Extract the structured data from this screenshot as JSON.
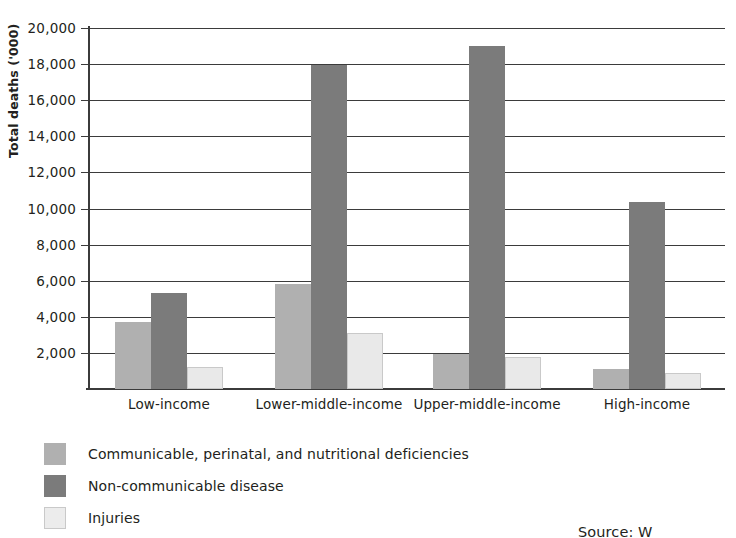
{
  "chart_data": {
    "type": "bar",
    "title": "",
    "xlabel": "",
    "ylabel": "Total deaths ('000)",
    "categories": [
      "Low-income",
      "Lower-middle-income",
      "Upper-middle-income",
      "High-income"
    ],
    "series": [
      {
        "name": "Communicable, perinatal, and nutritional deficiencies",
        "color": "#b0b0b0",
        "values": [
          3700,
          5800,
          1950,
          1100
        ]
      },
      {
        "name": "Non-communicable disease",
        "color": "#7b7b7b",
        "values": [
          5300,
          17950,
          19000,
          10350
        ]
      },
      {
        "name": "Injuries",
        "color": "#e9e9e9",
        "values": [
          1200,
          3100,
          1800,
          900
        ]
      }
    ],
    "ylim": [
      0,
      20000
    ],
    "yticks": [
      2000,
      4000,
      6000,
      8000,
      10000,
      12000,
      14000,
      16000,
      18000,
      20000
    ],
    "ytick_labels": [
      "2,000",
      "4,000",
      "6,000",
      "8,000",
      "10,000",
      "12,000",
      "14,000",
      "16,000",
      "18,000",
      "20,000"
    ],
    "grid": true,
    "legend_position": "below-left"
  },
  "legend": {
    "items": [
      {
        "label": "Communicable, perinatal, and nutritional deficiencies"
      },
      {
        "label": "Non-communicable disease"
      },
      {
        "label": "Injuries"
      }
    ]
  },
  "source_note": "Source: W"
}
